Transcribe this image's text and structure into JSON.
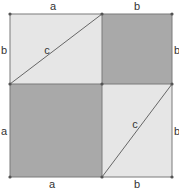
{
  "diagram": {
    "colors": {
      "light_fill": "#e6e6e6",
      "dark_fill": "#a9a9a9",
      "stroke": "#7a7a7a",
      "point": "#555555"
    },
    "labels": {
      "top_left": "a",
      "top_right": "b",
      "left_top": "b",
      "right_top": "b",
      "hyp_top": "c",
      "left_bottom": "a",
      "right_bottom": "b",
      "hyp_bottom": "c",
      "bottom_left": "a",
      "bottom_right": "b"
    },
    "regions": [
      {
        "name": "top-left-rectangle",
        "fill": "light",
        "split_by": "diagonal c"
      },
      {
        "name": "top-right-square",
        "fill": "dark",
        "side": "b"
      },
      {
        "name": "bottom-left-square",
        "fill": "dark",
        "side": "a"
      },
      {
        "name": "bottom-right-rectangle",
        "fill": "light",
        "split_by": "diagonal c"
      }
    ]
  }
}
